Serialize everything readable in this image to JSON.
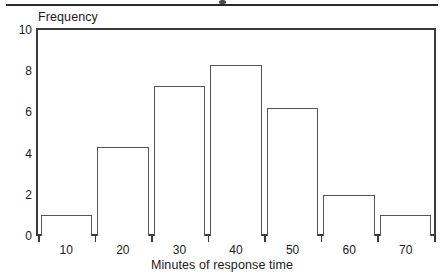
{
  "figure": {
    "top_rule": true,
    "title_cropped_remnant": true
  },
  "chart_data": {
    "type": "bar",
    "title": "",
    "xlabel": "Minutes of response time",
    "ylabel": "Frequency",
    "categories": [
      "10",
      "20",
      "30",
      "40",
      "50",
      "60",
      "70"
    ],
    "values": [
      1.0,
      4.3,
      7.3,
      8.3,
      6.2,
      2.0,
      1.0
    ],
    "ylim": [
      0,
      10
    ],
    "y_ticks": [
      "10",
      "8",
      "6",
      "4",
      "2",
      "0"
    ],
    "y_tick_values": [
      10,
      8,
      6,
      4,
      2,
      0
    ],
    "x_ticks": [
      "10",
      "20",
      "30",
      "40",
      "50",
      "60",
      "70"
    ],
    "grid": false,
    "legend": null,
    "bar_fill": "#ffffff",
    "bar_edge": "#55565a",
    "axis_color": "#3a3a3a"
  }
}
